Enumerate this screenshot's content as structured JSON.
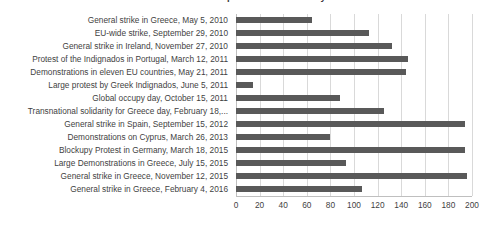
{
  "chart_data": {
    "type": "bar",
    "orientation": "horizontal",
    "title": "Selected transnational protest and solidarity events",
    "xlabel": "",
    "ylabel": "",
    "xlim": [
      0,
      200
    ],
    "xticks": [
      0,
      20,
      40,
      60,
      80,
      100,
      120,
      140,
      160,
      180,
      200
    ],
    "grid": true,
    "legend": "none",
    "bar_color": "#595959",
    "grid_color": "#d9d9d9",
    "categories": [
      "General strike in Greece, May 5, 2010",
      "EU-wide strike, September 29, 2010",
      "General strike in Ireland, November 27, 2010",
      "Protest of the Indignados in Portugal, March 12, 2011",
      "Demonstrations in eleven EU countries, May 21, 2011",
      "Large protest by Greek Indignados, June 5, 2011",
      "Global occupy day, October 15, 2011",
      "Transnational solidarity for Greece day, February 18,...",
      "General strike in Spain, September 15, 2012",
      "Demonstrations on Cyprus, March 26, 2013",
      "Blockupy Protest in Germany, March 18, 2015",
      "Large Demonstrations in Greece, July 15, 2015",
      "General strike in Greece, November 12, 2015",
      "General strike in Greece, February 4, 2016"
    ],
    "values": [
      64,
      113,
      132,
      146,
      144,
      14,
      88,
      125,
      194,
      80,
      194,
      93,
      196,
      107
    ]
  }
}
